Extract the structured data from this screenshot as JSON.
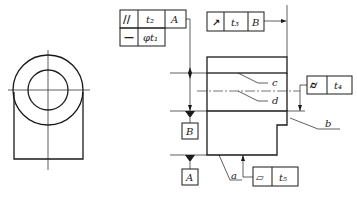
{
  "diagram": {
    "type": "engineering-drawing-geometric-tolerances",
    "frames": {
      "parallelism": {
        "symbol": "//",
        "tolerance": "t₂",
        "datum": "A"
      },
      "straightness": {
        "symbol": "—",
        "tolerance": "φt₁"
      },
      "runout": {
        "symbol": "↗",
        "tolerance": "t₃",
        "datum": "B"
      },
      "cylindricity": {
        "symbol": "⌭",
        "tolerance": "t₄"
      },
      "flatness": {
        "symbol": "▱",
        "tolerance": "t₅"
      }
    },
    "datums": {
      "b_label": "B",
      "a_label": "A"
    },
    "leaders": {
      "a": "a",
      "b": "b",
      "c": "c",
      "d": "d"
    }
  }
}
